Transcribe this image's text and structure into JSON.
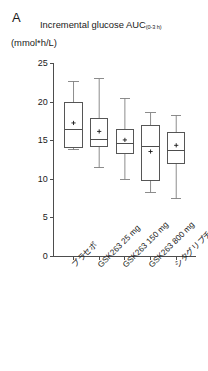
{
  "panel": {
    "label": "A"
  },
  "header": {
    "title_main": "Incremental glucose AUC",
    "title_subscript": "(0-3 h)",
    "y_unit": "(mmol*h/L)"
  },
  "chart_data": {
    "type": "box",
    "xlabel": "",
    "ylabel": "(mmol*h/L)",
    "ylim": [
      0,
      25
    ],
    "yticks": [
      0,
      5,
      10,
      15,
      20,
      25
    ],
    "ytick_labels": [
      "0",
      "5",
      "10",
      "15",
      "20",
      "25"
    ],
    "grid": false,
    "legend": null,
    "mean_marker": "+",
    "categories": [
      "プラセボ",
      "GSK263 25 mg",
      "GSK263 150 mg",
      "GSK263 800 mg",
      "シタグリプチン 100 mg"
    ],
    "boxes": [
      {
        "category": "プラセボ",
        "whisker_low": 13.8,
        "q1": 14.1,
        "median": 16.5,
        "q3": 19.9,
        "whisker_high": 22.7,
        "mean": 17.3
      },
      {
        "category": "GSK263 25 mg",
        "whisker_low": 11.5,
        "q1": 14.2,
        "median": 15.2,
        "q3": 17.9,
        "whisker_high": 23.0,
        "mean": 16.2
      },
      {
        "category": "GSK263 150 mg",
        "whisker_low": 10.0,
        "q1": 13.3,
        "median": 14.6,
        "q3": 16.5,
        "whisker_high": 20.5,
        "mean": 15.1
      },
      {
        "category": "GSK263 800 mg",
        "whisker_low": 8.3,
        "q1": 9.9,
        "median": 14.2,
        "q3": 17.0,
        "whisker_high": 18.6,
        "mean": 13.6
      },
      {
        "category": "シタグリプチン 100 mg",
        "whisker_low": 7.5,
        "q1": 12.1,
        "median": 13.7,
        "q3": 16.0,
        "whisker_high": 18.3,
        "mean": 14.4
      }
    ],
    "colors": {
      "axis": "#4d4d4d",
      "box_stroke": "#4d4d4d",
      "whisker": "#808080",
      "median": "#4d4d4d",
      "mean_marker": "#1a1a1a",
      "background": "#ffffff"
    }
  }
}
